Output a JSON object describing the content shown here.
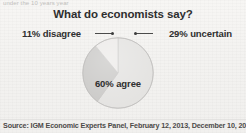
{
  "page": {
    "cropped_header_text": "under the 10 years year",
    "background_color": "#f3f2f0",
    "width": 246,
    "height": 133
  },
  "chart_data": {
    "type": "pie",
    "title": "What do economists say?",
    "categories": [
      "agree",
      "uncertain",
      "disagree"
    ],
    "values": [
      60,
      29,
      11
    ],
    "labels": [
      "60% agree",
      "29% uncertain",
      "11% disagree"
    ],
    "units": "percent",
    "slice_colors": [
      "#e3e2e0",
      "#c9c8c6",
      "#eceae8"
    ],
    "legend_position": "callout-labels",
    "grid": false,
    "start_angle_deg": 0,
    "annotations": [
      {
        "text": "11% disagree",
        "side": "left"
      },
      {
        "text": "29% uncertain",
        "side": "right"
      },
      {
        "text": "60% agree",
        "side": "inside"
      }
    ],
    "source": "Source: IGM Economic Experts Panel, February 12, 2013, December 10, 2013."
  },
  "slices": {
    "agree": {
      "label": "60% agree",
      "value": 60,
      "color": "#e3e2e0"
    },
    "uncertain": {
      "label": "29% uncertain",
      "value": 29,
      "color": "#c9c8c6"
    },
    "disagree": {
      "label": "11% disagree",
      "value": 11,
      "color": "#eceae8"
    }
  },
  "footer": {
    "source": "Source: IGM Economic Experts Panel, February 12, 2013, December 10, 2013."
  }
}
